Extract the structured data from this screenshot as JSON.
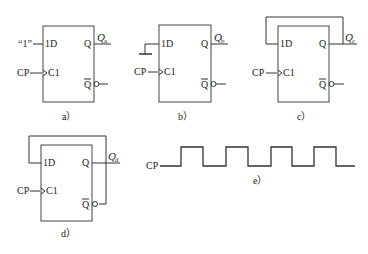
{
  "figures": {
    "a": {
      "caption": "a）",
      "d_input_label": "“1”",
      "d_pin": "1D",
      "clk_pin": "C1",
      "clk_label": "CP",
      "q_pin": "Q",
      "qbar_pin": "Q",
      "output_label": "Q",
      "output_sub": "a"
    },
    "b": {
      "caption": "b）",
      "d_input": "ground",
      "d_pin": "1D",
      "clk_pin": "C1",
      "clk_label": "CP",
      "q_pin": "Q",
      "qbar_pin": "Q",
      "output_label": "Q",
      "output_sub": "b"
    },
    "c": {
      "caption": "c）",
      "feedback": "Q to 1D",
      "d_pin": "1D",
      "clk_pin": "C1",
      "clk_label": "CP",
      "q_pin": "Q",
      "qbar_pin": "Q",
      "output_label": "Q",
      "output_sub": "c"
    },
    "d": {
      "caption": "d）",
      "feedback": "Q-bar to 1D",
      "d_pin": "1D",
      "clk_pin": "C1",
      "clk_label": "CP",
      "q_pin": "Q",
      "qbar_pin": "Q",
      "output_label": "Q",
      "output_sub": "d"
    },
    "e": {
      "caption": "e）",
      "signal_label": "CP",
      "pulse_count": 5
    }
  }
}
